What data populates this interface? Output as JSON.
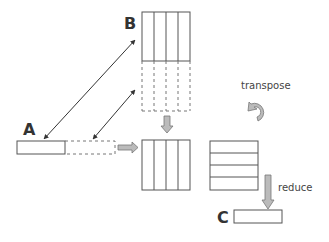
{
  "labels": {
    "a": "A",
    "b": "B",
    "c": "C"
  },
  "annotations": {
    "transpose": "transpose",
    "reduce": "reduce"
  },
  "icons": {
    "transpose": "curved-rotate-arrow",
    "reduce": "down-block-arrow",
    "broadcast_down": "down-block-arrow",
    "broadcast_right": "right-block-arrow"
  },
  "colors": {
    "stroke": "#555555",
    "arrow_fill": "#bbbbbb",
    "text": "#333333"
  },
  "matrices": {
    "b_columns": 4,
    "product_columns": 4,
    "transposed_rows": 4
  }
}
